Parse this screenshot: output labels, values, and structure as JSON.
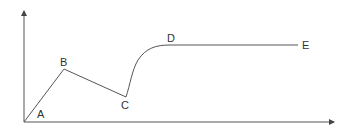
{
  "diagram": {
    "type": "line-curve",
    "points": [
      {
        "label": "A",
        "x": 24,
        "y": 122,
        "label_x": 38,
        "label_y": 118
      },
      {
        "label": "B",
        "x": 64,
        "y": 69,
        "label_x": 60,
        "label_y": 66
      },
      {
        "label": "C",
        "x": 126,
        "y": 97,
        "label_x": 122,
        "label_y": 109
      },
      {
        "label": "D",
        "x": 170,
        "y": 45,
        "label_x": 167,
        "label_y": 42
      },
      {
        "label": "E",
        "x": 298,
        "y": 45,
        "label_x": 302,
        "label_y": 49
      }
    ],
    "colors": {
      "line": "#555555",
      "axis": "#555555",
      "label": "#333333"
    }
  },
  "labels": {
    "A": "A",
    "B": "B",
    "C": "C",
    "D": "D",
    "E": "E"
  }
}
